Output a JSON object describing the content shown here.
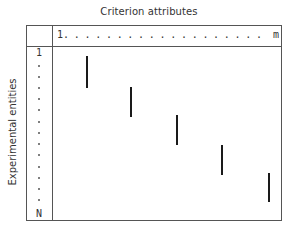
{
  "diagram": {
    "title": "Criterion attributes",
    "column_axis": {
      "start": "1",
      "dots": "...................",
      "end": "m"
    },
    "row_axis_label": "Experimental entities",
    "row_axis": {
      "start": "1",
      "end": "N",
      "dot_count": 13
    },
    "bars": [
      {
        "id": 1,
        "x": 87,
        "y1": 56,
        "y2": 88
      },
      {
        "id": 2,
        "x": 131,
        "y1": 87,
        "y2": 117
      },
      {
        "id": 3,
        "x": 177,
        "y1": 115,
        "y2": 145
      },
      {
        "id": 4,
        "x": 222,
        "y1": 145,
        "y2": 175
      },
      {
        "id": 5,
        "x": 269,
        "y1": 173,
        "y2": 202
      }
    ],
    "colors": {
      "line": "#555555",
      "bar": "#1a1a1a",
      "text": "#333333"
    }
  }
}
